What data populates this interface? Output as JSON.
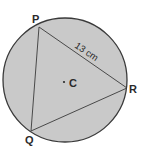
{
  "diagram": {
    "type": "circle-inscribed-triangle",
    "colors": {
      "circle_fill": "#c9c9c9",
      "stroke": "#3a3a3a",
      "background": "#ffffff",
      "text": "#2a2a2a"
    },
    "circle": {
      "center_label": "C",
      "cx": 65,
      "cy": 80,
      "r": 62
    },
    "vertices": [
      {
        "label": "P",
        "x": 39,
        "y": 27
      },
      {
        "label": "R",
        "x": 127,
        "y": 88
      },
      {
        "label": "Q",
        "x": 31,
        "y": 131
      }
    ],
    "side_label": {
      "text": "13 cm",
      "side": "PR"
    }
  }
}
